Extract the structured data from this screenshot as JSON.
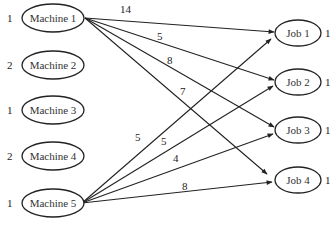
{
  "diagram": {
    "type": "bipartite-network",
    "sources": [
      {
        "id": "m1",
        "label": "Machine 1",
        "supply": "1",
        "cx": 53,
        "cy": 18
      },
      {
        "id": "m2",
        "label": "Machine 2",
        "supply": "2",
        "cx": 53,
        "cy": 65
      },
      {
        "id": "m3",
        "label": "Machine 3",
        "supply": "1",
        "cx": 53,
        "cy": 110
      },
      {
        "id": "m4",
        "label": "Machine 4",
        "supply": "2",
        "cx": 53,
        "cy": 156
      },
      {
        "id": "m5",
        "label": "Machine 5",
        "supply": "1",
        "cx": 53,
        "cy": 203
      }
    ],
    "sinks": [
      {
        "id": "j1",
        "label": "Job 1",
        "demand": "1",
        "cx": 298,
        "cy": 33
      },
      {
        "id": "j2",
        "label": "Job 2",
        "demand": "1",
        "cx": 298,
        "cy": 82
      },
      {
        "id": "j3",
        "label": "Job 3",
        "demand": "1",
        "cx": 298,
        "cy": 130
      },
      {
        "id": "j4",
        "label": "Job 4",
        "demand": "1",
        "cx": 298,
        "cy": 180
      }
    ],
    "edges": [
      {
        "from": "Machine 1",
        "to": "Job 1",
        "weight": "14"
      },
      {
        "from": "Machine 1",
        "to": "Job 2",
        "weight": "5"
      },
      {
        "from": "Machine 1",
        "to": "Job 3",
        "weight": "8"
      },
      {
        "from": "Machine 1",
        "to": "Job 4",
        "weight": "7"
      },
      {
        "from": "Machine 5",
        "to": "Job 1",
        "weight": "5"
      },
      {
        "from": "Machine 5",
        "to": "Job 2",
        "weight": "5"
      },
      {
        "from": "Machine 5",
        "to": "Job 3",
        "weight": "4"
      },
      {
        "from": "Machine 5",
        "to": "Job 4",
        "weight": "8"
      }
    ]
  },
  "colors": {
    "stroke": "#222222",
    "text": "#333333",
    "background": "#ffffff"
  }
}
